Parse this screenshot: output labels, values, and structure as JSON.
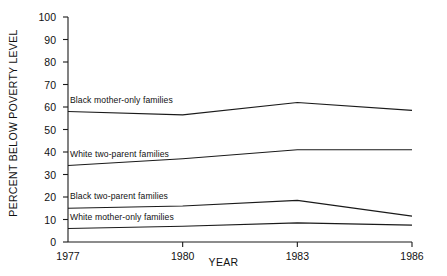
{
  "chart_data": {
    "type": "line",
    "title": "",
    "xlabel": "YEAR",
    "ylabel": "PERCENT BELOW POVERTY LEVEL",
    "x": [
      1977,
      1980,
      1983,
      1986
    ],
    "xtick_labels": [
      "1977",
      "1980",
      "1983",
      "1986"
    ],
    "ytick_labels": [
      "0",
      "10",
      "20",
      "30",
      "40",
      "50",
      "60",
      "70",
      "80",
      "90",
      "100"
    ],
    "yticks": [
      0,
      10,
      20,
      30,
      40,
      50,
      60,
      70,
      80,
      90,
      100
    ],
    "ylim": [
      0,
      100
    ],
    "xlim": [
      1977,
      1986
    ],
    "grid": false,
    "legend_position": "inline-above-line",
    "line_color": "#1a1a1a",
    "background_color": "#ffffff",
    "series": [
      {
        "name": "Black mother-only families",
        "label": "Black mother-only families",
        "values": [
          58,
          56.5,
          62,
          58.5
        ]
      },
      {
        "name": "White two-parent families",
        "label": "White two-parent families",
        "values": [
          34,
          37,
          41,
          41
        ]
      },
      {
        "name": "Black two-parent families",
        "label": "Black two-parent families",
        "values": [
          15,
          16,
          18.5,
          11.5
        ]
      },
      {
        "name": "White mother-only families",
        "label": "White mother-only families",
        "values": [
          6,
          7,
          8.5,
          7.5
        ]
      }
    ]
  },
  "axes": {
    "y_axis_title": "PERCENT BELOW POVERTY LEVEL",
    "x_axis_title": "YEAR"
  }
}
